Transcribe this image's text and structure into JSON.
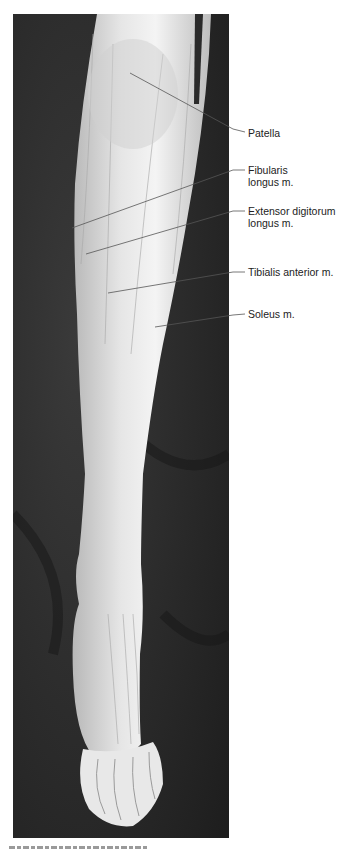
{
  "figure": {
    "type": "anatomical-photograph",
    "colors": {
      "background": "#2a2a2a",
      "tissue": "#d8d8d8",
      "tissue_highlight": "#f2f2f2",
      "leader_line": "#555555",
      "label_text": "#222222"
    },
    "labels": [
      {
        "id": "patella",
        "text": "Patella",
        "top": 127,
        "leader": {
          "x1": 130,
          "y1": 73,
          "x2": 245,
          "y2": 132
        }
      },
      {
        "id": "fibularis-longus",
        "text": "Fibularis\nlongus m.",
        "top": 164,
        "leader": {
          "x1": 72,
          "y1": 228,
          "x2": 245,
          "y2": 170
        }
      },
      {
        "id": "extensor-digitorum-longus",
        "text": "Extensor digitorum\nlongus m.",
        "top": 205,
        "leader": {
          "x1": 86,
          "y1": 254,
          "x2": 245,
          "y2": 211
        }
      },
      {
        "id": "tibialis-anterior",
        "text": "Tibialis anterior m.",
        "top": 266,
        "leader": {
          "x1": 108,
          "y1": 293,
          "x2": 245,
          "y2": 272
        }
      },
      {
        "id": "soleus",
        "text": "Soleus m.",
        "top": 308,
        "leader": {
          "x1": 155,
          "y1": 327,
          "x2": 245,
          "y2": 314
        }
      }
    ],
    "caption": {
      "visible": "truncated"
    }
  }
}
